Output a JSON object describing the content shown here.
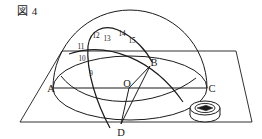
{
  "figure": {
    "caption": "図 4",
    "caption_label": "Figure 4",
    "width": 262,
    "height": 139,
    "background_color": "#ffffff",
    "ink_color": "#1b1b1b"
  },
  "points": [
    {
      "id": "A",
      "label": "A",
      "x": 54,
      "y": 88
    },
    {
      "id": "B",
      "label": "B",
      "x": 151,
      "y": 62
    },
    {
      "id": "C",
      "label": "C",
      "x": 207,
      "y": 88
    },
    {
      "id": "D",
      "label": "D",
      "x": 121,
      "y": 128
    },
    {
      "id": "O",
      "label": "O",
      "x": 126,
      "y": 83
    }
  ],
  "arc_marks": [
    {
      "id": "m9",
      "label": "9",
      "x": 91,
      "y": 73
    },
    {
      "id": "m10",
      "label": "10",
      "x": 82,
      "y": 58
    },
    {
      "id": "m11",
      "label": "11",
      "x": 81,
      "y": 46
    },
    {
      "id": "m12",
      "label": "12",
      "x": 96,
      "y": 35
    },
    {
      "id": "m13",
      "label": "13",
      "x": 106,
      "y": 38
    },
    {
      "id": "m14",
      "label": "14",
      "x": 121,
      "y": 33
    },
    {
      "id": "m15",
      "label": "15",
      "x": 131,
      "y": 40
    }
  ],
  "objects": {
    "compass": {
      "name": "compass",
      "center_x": 205,
      "center_y": 111,
      "radius_x": 15,
      "radius_y": 7,
      "thickness": 5
    }
  },
  "geometry": {
    "ground_plane": {
      "name": "horizontal-plane",
      "points": "62,122 20,122 62,51 236,51 252,122 62,122"
    },
    "horizon_circle": {
      "center_x": 130,
      "center_y": 88,
      "radius_x": 77,
      "radius_y": 32
    },
    "dome": {
      "center_x": 130,
      "center_y": 88,
      "radius_x": 77,
      "radius_y": 78
    }
  }
}
